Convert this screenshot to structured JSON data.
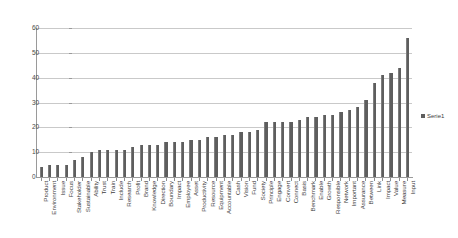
{
  "chart_data": {
    "type": "bar",
    "title": "",
    "subtitle": "",
    "xlabel": "",
    "ylabel": "",
    "ylim": [
      0,
      60
    ],
    "y_ticks": [
      0,
      10,
      20,
      30,
      40,
      50,
      60
    ],
    "grid": true,
    "legend_position": "right",
    "series": [
      {
        "name": "Serie1",
        "color": "#5e5e5e",
        "values": [
          4,
          5,
          5,
          5,
          7,
          8,
          10,
          11,
          11,
          11,
          11,
          12,
          13,
          13,
          13,
          14,
          14,
          14,
          15,
          15,
          16,
          16,
          17,
          17,
          18,
          18,
          19,
          22,
          22,
          22,
          22,
          23,
          24,
          24,
          25,
          25,
          26,
          27,
          28,
          31,
          38,
          41,
          42,
          44,
          56
        ]
      }
    ],
    "categories": [
      "Product",
      "Environment",
      "Issue",
      "Focus",
      "Stakeholder",
      "Sustainable",
      "Ability",
      "Trust",
      "Train",
      "Include",
      "Research",
      "Profit",
      "Brand",
      "Knowledge",
      "Direction",
      "Boundary",
      "Impact",
      "Employee",
      "Asset",
      "Productivity",
      "Resource",
      "Equipment",
      "Accountable",
      "Cash",
      "Vision",
      "Fund",
      "Society",
      "Principle",
      "Engage",
      "Convert",
      "Connect",
      "Basis",
      "Benchmark",
      "Enable",
      "Growth",
      "Responsible",
      "Network",
      "Important",
      "Assurance",
      "Between",
      "Link",
      "Impact",
      "Value",
      "Measure",
      "Input"
    ]
  },
  "legend": {
    "entries": [
      {
        "label": "Serie1",
        "swatch_name": "legend-swatch-serie1"
      }
    ]
  },
  "axes": {
    "y_axis_name": "value-axis",
    "x_axis_name": "category-axis"
  }
}
